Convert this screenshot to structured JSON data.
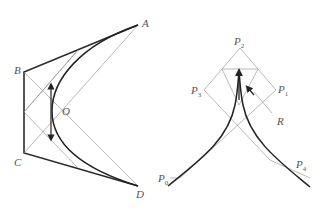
{
  "left_diagram": {
    "labels": {
      "A": "A",
      "B": "B",
      "C": "C",
      "D": "D",
      "O": "O"
    }
  },
  "right_diagram": {
    "labels": {
      "P0": "P",
      "P0_sub": "0",
      "P1": "P",
      "P1_sub": "1",
      "P2": "P",
      "P2_sub": "2",
      "P3": "P",
      "P3_sub": "3",
      "P4": "P",
      "P4_sub": "4",
      "R": "R"
    }
  },
  "colors": {
    "stroke_dark": "#2a2a2a",
    "stroke_light": "#8a8a8a",
    "label": "#555555"
  }
}
